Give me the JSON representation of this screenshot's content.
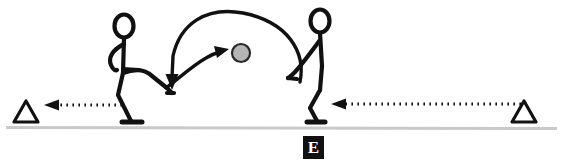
{
  "scene": {
    "width": 563,
    "height": 167,
    "background_color": "#ffffff",
    "title": "soccer kick diagram",
    "description": "Two stick figures on a ground line; a ball is lofted in an arc from the left kicker toward the right figure, with dotted arrows pointing left toward outline triangles at each end."
  },
  "colors": {
    "ink": "#111111",
    "ball_fill": "#b5b5b5",
    "ball_stroke": "#2a2a2a",
    "ground_line": "#c9c9c9",
    "label_background": "#111111",
    "label_text": "#ffffff"
  },
  "labels": {
    "marker_e": "E"
  },
  "figures": [
    {
      "name": "left-player-kicking",
      "role": "kicker",
      "facing": "right",
      "head_center_x": 124,
      "head_center_y": 26,
      "foot_x": 132,
      "foot_y": 122
    },
    {
      "name": "right-player-receiving",
      "role": "receiver",
      "facing": "left",
      "head_center_x": 320,
      "head_center_y": 21,
      "foot_x": 315,
      "foot_y": 122
    }
  ],
  "ball": {
    "name": "ball",
    "center_x": 241,
    "center_y": 53,
    "radius": 9,
    "fill": "#b5b5b5"
  },
  "arrows": [
    {
      "name": "ball-flight-arc",
      "style": "solid-curved",
      "direction": "right-to-left-loop",
      "from_x": 300,
      "from_y": 82,
      "to_x": 172,
      "to_y": 86,
      "description": "large arc over both players showing ball flight path"
    },
    {
      "name": "kick-direction-arrow",
      "style": "solid-curved",
      "direction": "left-to-right",
      "from_x": 166,
      "from_y": 87,
      "to_x": 224,
      "to_y": 50,
      "description": "short curved arrow from kicking foot toward the ball"
    },
    {
      "name": "left-movement-arrow",
      "style": "dotted",
      "direction": "left",
      "from_x": 122,
      "from_y": 105,
      "to_x": 44,
      "to_y": 105
    },
    {
      "name": "right-movement-arrow",
      "style": "dotted",
      "direction": "left",
      "from_x": 527,
      "from_y": 104,
      "to_x": 331,
      "to_y": 104
    }
  ],
  "markers": [
    {
      "name": "left-cone-marker",
      "shape": "triangle-outline",
      "center_x": 26,
      "base_y": 122
    },
    {
      "name": "right-cone-marker",
      "shape": "triangle-outline",
      "center_x": 524,
      "base_y": 122
    }
  ],
  "ground": {
    "name": "ground-line",
    "y": 127,
    "x_start": 6,
    "x_end": 557
  }
}
